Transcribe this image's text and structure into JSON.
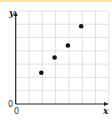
{
  "chart_data": {
    "type": "scatter",
    "title": "",
    "xlabel": "x",
    "ylabel": "y",
    "origin_labels": [
      "0",
      "0"
    ],
    "x": [
      2,
      3,
      4,
      5
    ],
    "y": [
      2.35,
      3.5,
      4.4,
      5.85
    ],
    "xlim": [
      0,
      7
    ],
    "ylim": [
      0,
      7
    ],
    "grid": true,
    "tick_labels_shown": false,
    "legend": null,
    "colors": {
      "points": "#111111",
      "axes": "#222222",
      "grid": "#d9d9d9",
      "top_strip": "#f5e4a6"
    }
  },
  "axes": {
    "x_label": "x",
    "y_label": "y",
    "origin_x": "0",
    "origin_y": "0"
  }
}
